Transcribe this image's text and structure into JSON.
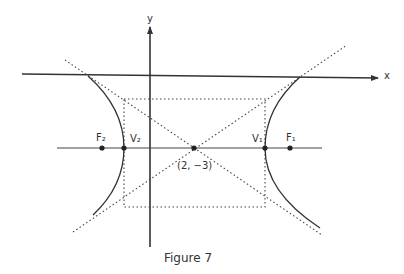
{
  "figure": {
    "caption": "Figure 7",
    "axes": {
      "x_label": "x",
      "y_label": "y"
    },
    "center_label": "(2, −3)",
    "points": {
      "F2": "F₂",
      "V2": "V₂",
      "V1": "V₁",
      "F1": "F₁"
    },
    "colors": {
      "ink": "#333333",
      "background": "#ffffff"
    }
  }
}
